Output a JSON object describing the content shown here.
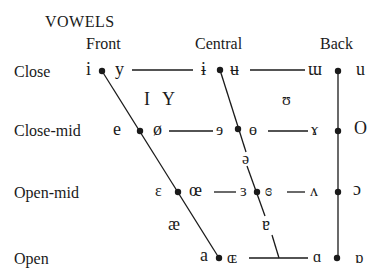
{
  "title": "VOWELS",
  "columns": {
    "front": "Front",
    "central": "Central",
    "back": "Back"
  },
  "rows": {
    "close": "Close",
    "close_mid": "Close-mid",
    "open_mid": "Open-mid",
    "open": "Open"
  },
  "symbols": {
    "close": {
      "front_unrounded": "i",
      "front_rounded": "y",
      "central_unrounded": "ɨ",
      "central_rounded": "ʉ",
      "back_unrounded": "ɯ",
      "back_rounded": "u"
    },
    "near_close": {
      "front_unrounded": "I",
      "front_rounded": "Y",
      "back_rounded": "ʊ"
    },
    "close_mid": {
      "front_unrounded": "e",
      "front_rounded": "ø",
      "central_unrounded": "ɘ",
      "central_rounded": "ɵ",
      "back_unrounded": "ɤ",
      "back_rounded": "O"
    },
    "mid": {
      "central": "ə"
    },
    "open_mid": {
      "front_unrounded": "ɛ",
      "front_rounded": "œ",
      "central_unrounded": "ɜ",
      "central_rounded": "ɞ",
      "back_unrounded": "ʌ",
      "back_rounded": "ɔ"
    },
    "near_open": {
      "front": "æ",
      "central": "ɐ"
    },
    "open": {
      "front_unrounded": "a",
      "front_rounded": "ɶ",
      "back_unrounded": "ɑ",
      "back_rounded": "ɒ"
    }
  },
  "colors": {
    "ink": "#1a1a1a",
    "background": "#ffffff"
  }
}
